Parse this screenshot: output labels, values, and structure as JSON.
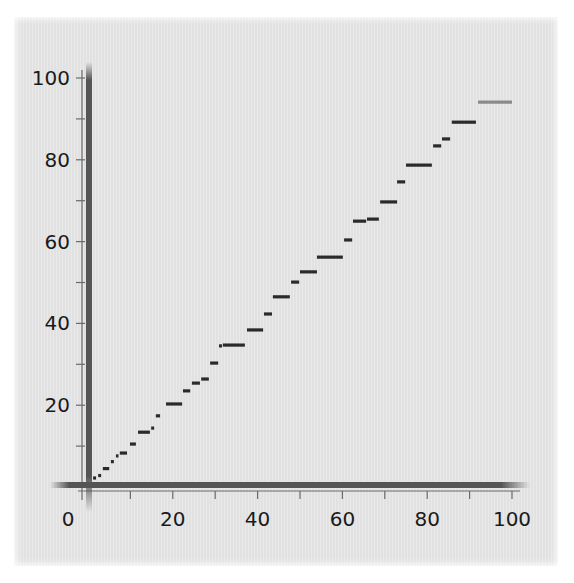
{
  "chart_data": {
    "type": "line",
    "subtype": "step-segments",
    "title": "",
    "xlabel": "",
    "ylabel": "",
    "xlim": [
      0,
      100
    ],
    "ylim": [
      0,
      100
    ],
    "x_ticks_major": [
      0,
      20,
      40,
      60,
      80,
      100
    ],
    "x_tick_labels": [
      "0",
      "20",
      "40",
      "60",
      "80",
      "100"
    ],
    "x_ticks_minor": [
      10,
      30,
      50,
      70,
      90
    ],
    "y_ticks_major": [
      20,
      40,
      60,
      80,
      100
    ],
    "y_tick_labels": [
      "20",
      "40",
      "60",
      "80",
      "100"
    ],
    "y_ticks_minor": [
      10,
      30,
      50,
      70,
      90
    ],
    "grid": false,
    "legend": null,
    "series": [
      {
        "name": "steps",
        "color": "#2a2a2a",
        "segments": [
          {
            "x0": 1.2,
            "x1": 1.9,
            "y": 2.2
          },
          {
            "x0": 2.4,
            "x1": 3.1,
            "y": 2.8
          },
          {
            "x0": 3.5,
            "x1": 5.0,
            "y": 4.5
          },
          {
            "x0": 5.4,
            "x1": 6.1,
            "y": 6.2
          },
          {
            "x0": 6.6,
            "x1": 6.9,
            "y": 7.6
          },
          {
            "x0": 7.5,
            "x1": 9.2,
            "y": 8.3
          },
          {
            "x0": 9.9,
            "x1": 11.3,
            "y": 10.5
          },
          {
            "x0": 11.8,
            "x1": 14.6,
            "y": 13.4
          },
          {
            "x0": 14.9,
            "x1": 15.6,
            "y": 14.4
          },
          {
            "x0": 16.0,
            "x1": 17.0,
            "y": 17.4
          },
          {
            "x0": 18.4,
            "x1": 22.2,
            "y": 20.3
          },
          {
            "x0": 22.4,
            "x1": 24.1,
            "y": 23.5
          },
          {
            "x0": 24.5,
            "x1": 26.4,
            "y": 25.4
          },
          {
            "x0": 26.7,
            "x1": 28.5,
            "y": 26.4
          },
          {
            "x0": 28.8,
            "x1": 30.7,
            "y": 30.3
          },
          {
            "x0": 30.9,
            "x1": 31.6,
            "y": 34.5
          },
          {
            "x0": 31.8,
            "x1": 37.0,
            "y": 34.7
          },
          {
            "x0": 37.5,
            "x1": 41.3,
            "y": 38.4
          },
          {
            "x0": 41.5,
            "x1": 43.4,
            "y": 42.3
          },
          {
            "x0": 43.6,
            "x1": 47.6,
            "y": 46.5
          },
          {
            "x0": 47.9,
            "x1": 49.8,
            "y": 50.1
          },
          {
            "x0": 50.0,
            "x1": 54.0,
            "y": 52.6
          },
          {
            "x0": 54.0,
            "x1": 60.1,
            "y": 56.2
          },
          {
            "x0": 60.4,
            "x1": 62.3,
            "y": 60.4
          },
          {
            "x0": 62.5,
            "x1": 65.6,
            "y": 65.0
          },
          {
            "x0": 65.8,
            "x1": 68.6,
            "y": 65.5
          },
          {
            "x0": 68.9,
            "x1": 72.9,
            "y": 69.7
          },
          {
            "x0": 72.9,
            "x1": 74.8,
            "y": 74.6
          },
          {
            "x0": 75.0,
            "x1": 81.1,
            "y": 78.7
          },
          {
            "x0": 81.4,
            "x1": 83.3,
            "y": 83.4
          },
          {
            "x0": 83.5,
            "x1": 85.4,
            "y": 85.1
          },
          {
            "x0": 85.8,
            "x1": 91.5,
            "y": 89.2
          },
          {
            "x0": 92.0,
            "x1": 100.0,
            "y": 94.1,
            "color": "#8a8a8a"
          }
        ]
      }
    ]
  },
  "colors": {
    "panel_bg": "#e6e6e6",
    "axis_thick": "#555555",
    "axis_thin": "#6a6a6a",
    "segment": "#2a2a2a",
    "last_segment": "#8a8a8a",
    "label": "#1a1a1a"
  }
}
